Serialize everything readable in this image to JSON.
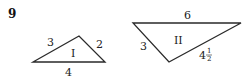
{
  "problem_number": "9",
  "triangles": [
    {
      "label": "I",
      "sides": {
        "left": "3",
        "right": "2",
        "bottom": "4"
      }
    },
    {
      "label": "II",
      "sides": {
        "top": "6",
        "left": "3",
        "right_whole": "4",
        "right_frac_num": "1",
        "right_frac_den": "2"
      }
    }
  ],
  "colors": {
    "stroke": "#2a2a2a",
    "text": "#222222"
  }
}
